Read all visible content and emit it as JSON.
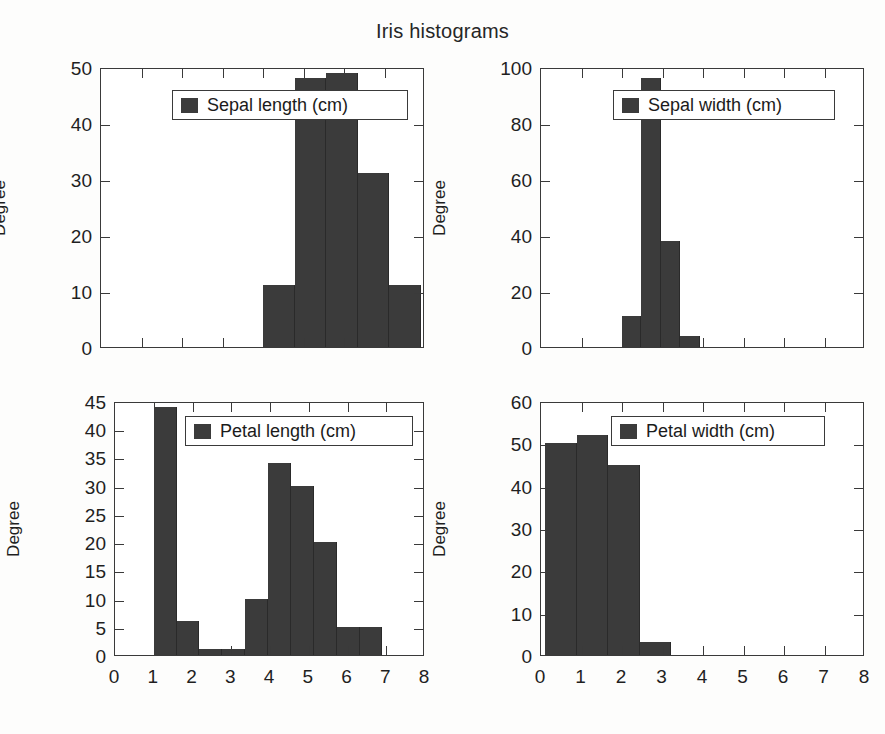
{
  "figure": {
    "title": "Iris histograms",
    "bar_color": "#3b3b3b",
    "axis_color": "#3a3a3a",
    "background": "#fdfdfc"
  },
  "chart_data": [
    {
      "id": "sepal-length",
      "type": "bar",
      "title": "",
      "legend_label": "Sepal length (cm)",
      "legend_position": "upper center",
      "xlabel": "",
      "ylabel": "Degree",
      "xlim": [
        0,
        8
      ],
      "ylim": [
        0,
        50
      ],
      "xticks": [
        0,
        1,
        2,
        3,
        4,
        5,
        6,
        7,
        8
      ],
      "xticklabels": [
        "",
        "",
        "",
        "",
        "",
        "",
        "",
        "",
        ""
      ],
      "yticks": [
        0,
        10,
        20,
        30,
        40,
        50
      ],
      "yticklabels": [
        "0",
        "10",
        "20",
        "30",
        "40",
        "50"
      ],
      "grid": false,
      "bin_edges": [
        4.0,
        4.78,
        5.56,
        6.34,
        7.12,
        7.9
      ],
      "values": [
        11,
        48,
        49,
        31,
        11
      ]
    },
    {
      "id": "sepal-width",
      "type": "bar",
      "title": "",
      "legend_label": "Sepal width (cm)",
      "legend_position": "upper center",
      "xlabel": "",
      "ylabel": "Degree",
      "xlim": [
        0,
        8
      ],
      "ylim": [
        0,
        100
      ],
      "xticks": [
        0,
        1,
        2,
        3,
        4,
        5,
        6,
        7,
        8
      ],
      "xticklabels": [
        "",
        "",
        "",
        "",
        "",
        "",
        "",
        "",
        ""
      ],
      "yticks": [
        0,
        20,
        40,
        60,
        80,
        100
      ],
      "yticklabels": [
        "0",
        "20",
        "40",
        "60",
        "80",
        "100"
      ],
      "grid": false,
      "bin_edges": [
        2.0,
        2.48,
        2.96,
        3.44,
        3.92
      ],
      "values": [
        11,
        96,
        38,
        4
      ]
    },
    {
      "id": "petal-length",
      "type": "bar",
      "title": "",
      "legend_label": "Petal length (cm)",
      "legend_position": "upper center",
      "xlabel": "",
      "ylabel": "Degree",
      "xlim": [
        0,
        8
      ],
      "ylim": [
        0,
        45
      ],
      "xticks": [
        0,
        1,
        2,
        3,
        4,
        5,
        6,
        7,
        8
      ],
      "xticklabels": [
        "0",
        "1",
        "2",
        "3",
        "4",
        "5",
        "6",
        "7",
        "8"
      ],
      "yticks": [
        0,
        5,
        10,
        15,
        20,
        25,
        30,
        35,
        40,
        45
      ],
      "yticklabels": [
        "0",
        "5",
        "10",
        "15",
        "20",
        "25",
        "30",
        "35",
        "40",
        "45"
      ],
      "grid": false,
      "bin_edges": [
        1.0,
        1.59,
        2.18,
        2.77,
        3.36,
        3.95,
        4.54,
        5.13,
        5.72,
        6.31,
        6.9
      ],
      "values": [
        44,
        6,
        1,
        1,
        10,
        34,
        30,
        20,
        5,
        5
      ]
    },
    {
      "id": "petal-width",
      "type": "bar",
      "title": "",
      "legend_label": "Petal width (cm)",
      "legend_position": "upper center",
      "xlabel": "",
      "ylabel": "Degree",
      "xlim": [
        0,
        8
      ],
      "ylim": [
        0,
        60
      ],
      "xticks": [
        0,
        1,
        2,
        3,
        4,
        5,
        6,
        7,
        8
      ],
      "xticklabels": [
        "0",
        "1",
        "2",
        "3",
        "4",
        "5",
        "6",
        "7",
        "8"
      ],
      "yticks": [
        0,
        10,
        20,
        30,
        40,
        50,
        60
      ],
      "yticklabels": [
        "0",
        "10",
        "20",
        "30",
        "40",
        "50",
        "60"
      ],
      "grid": false,
      "bin_edges": [
        0.1,
        0.88,
        1.66,
        2.44,
        3.22
      ],
      "values": [
        50,
        52,
        45,
        3
      ]
    }
  ]
}
